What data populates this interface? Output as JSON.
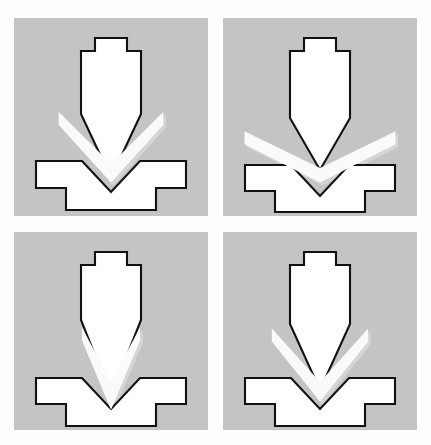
{
  "figure": {
    "canvas": {
      "width": 431,
      "height": 445
    },
    "colors": {
      "page_background": "#fdfdfd",
      "panel_background": "#c4c4c4",
      "tool_fill": "#ffffff",
      "tool_outline": "#111111",
      "sheet_fill": "#fafafa",
      "sheet_shadow": "#d8d8d8"
    },
    "stroke_width": 2.1,
    "panel_layout": {
      "columns": 2,
      "rows": 2,
      "gutter_x": 14,
      "gutter_y": 16
    }
  },
  "panels": [
    {
      "id": "panel-top-left",
      "label": "Stage 1",
      "position": {
        "x": 14,
        "y": 18,
        "width": 194,
        "height": 198
      },
      "bend_angle_deg": 45,
      "stage_order": 2,
      "sheet": {
        "half_span": 74,
        "thickness": 13,
        "hinge_x": 97,
        "hinge_y": 146,
        "arm_drop": 56
      },
      "punch": {
        "center_x": 97,
        "tang_top_y": 20,
        "tang_half_width": 16,
        "shoulder_y": 33,
        "body_half_width": 30,
        "body_top_y": 33,
        "flank_start_y": 96,
        "tip_y": 160
      },
      "die": {
        "left": 22,
        "right": 172,
        "top": 143,
        "body_bottom": 170,
        "pedestal_left": 52,
        "pedestal_right": 142,
        "pedestal_bottom": 192,
        "notch_half_width": 29,
        "notch_depth": 31
      }
    },
    {
      "id": "panel-top-right",
      "label": "Stage 2",
      "position": {
        "x": 223,
        "y": 18,
        "width": 194,
        "height": 198
      },
      "bend_angle_deg": 26,
      "stage_order": 1,
      "sheet": {
        "half_span": 84,
        "thickness": 13,
        "hinge_x": 97,
        "hinge_y": 150,
        "arm_drop": 41
      },
      "punch": {
        "center_x": 97,
        "tang_top_y": 20,
        "tang_half_width": 16,
        "shoulder_y": 33,
        "body_half_width": 30,
        "body_top_y": 33,
        "flank_start_y": 100,
        "tip_y": 152
      },
      "die": {
        "left": 22,
        "right": 172,
        "top": 147,
        "body_bottom": 173,
        "pedestal_left": 52,
        "pedestal_right": 142,
        "pedestal_bottom": 194,
        "notch_half_width": 29,
        "notch_depth": 31
      }
    },
    {
      "id": "panel-bottom-left",
      "label": "Stage 3",
      "position": {
        "x": 14,
        "y": 232,
        "width": 194,
        "height": 198
      },
      "bend_angle_deg": 62,
      "stage_order": 4,
      "sheet": {
        "half_span": 62,
        "thickness": 13,
        "hinge_x": 97,
        "hinge_y": 150,
        "arm_drop": 78
      },
      "punch": {
        "center_x": 97,
        "tang_top_y": 20,
        "tang_half_width": 16,
        "shoulder_y": 33,
        "body_half_width": 30,
        "body_top_y": 33,
        "flank_start_y": 88,
        "tip_y": 164
      },
      "die": {
        "left": 22,
        "right": 172,
        "top": 146,
        "body_bottom": 172,
        "pedestal_left": 52,
        "pedestal_right": 142,
        "pedestal_bottom": 194,
        "notch_half_width": 29,
        "notch_depth": 31
      }
    },
    {
      "id": "panel-bottom-right",
      "label": "Stage 4",
      "position": {
        "x": 223,
        "y": 232,
        "width": 194,
        "height": 198
      },
      "bend_angle_deg": 48,
      "stage_order": 3,
      "sheet": {
        "half_span": 72,
        "thickness": 13,
        "hinge_x": 97,
        "hinge_y": 150,
        "arm_drop": 62
      },
      "punch": {
        "center_x": 97,
        "tang_top_y": 20,
        "tang_half_width": 16,
        "shoulder_y": 33,
        "body_half_width": 30,
        "body_top_y": 33,
        "flank_start_y": 92,
        "tip_y": 158
      },
      "die": {
        "left": 22,
        "right": 172,
        "top": 146,
        "body_bottom": 172,
        "pedestal_left": 52,
        "pedestal_right": 142,
        "pedestal_bottom": 194,
        "notch_half_width": 29,
        "notch_depth": 31
      }
    }
  ]
}
